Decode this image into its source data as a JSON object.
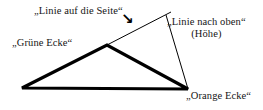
{
  "diagram": {
    "background_color": "#ffffff",
    "stroke_color": "#000000",
    "labels": {
      "side_line": "„Linie auf die Seite“",
      "green_corner": "„Grüne Ecke“",
      "up_line": "„Linie nach oben“",
      "up_line_sub": "(Höhe)",
      "orange_corner": "„Orange Ecke“"
    },
    "arrow_glyph": "↘",
    "geometry": {
      "triangle": {
        "left_vertex": [
          22,
          88
        ],
        "apex_vertex": [
          107,
          45
        ],
        "right_vertex": [
          188,
          89
        ],
        "stroke_width": 3.2
      },
      "extension_line": {
        "from": [
          107,
          45
        ],
        "to": [
          171,
          12
        ],
        "stroke_width": 1
      },
      "height_line": {
        "from": [
          166,
          15
        ],
        "to": [
          188,
          89
        ],
        "stroke_width": 1
      }
    }
  }
}
